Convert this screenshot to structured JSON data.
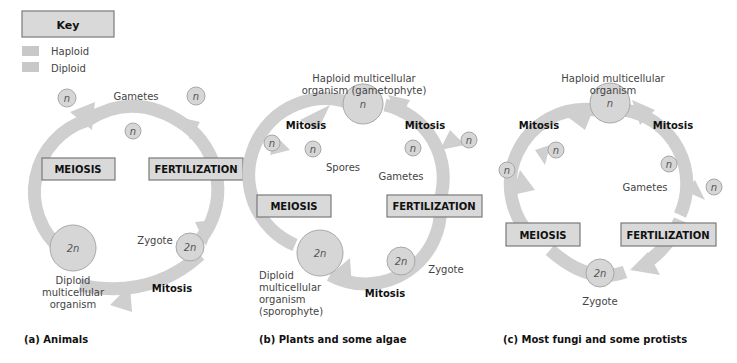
{
  "key": {
    "title": "Key",
    "items": [
      {
        "label": "Haploid",
        "color": "#c8c8c8"
      },
      {
        "label": "Diploid",
        "color": "#c8c8c8"
      }
    ]
  },
  "colors": {
    "arrow": "#cfcfcf",
    "circle_fill": "#d6d6d6",
    "circle_stroke": "#a8a8a8",
    "box_fill": "#d9d9d9",
    "box_stroke": "#7a7a7a"
  },
  "panels": [
    {
      "caption": "(a) Animals",
      "labels": {
        "gametes": "Gametes",
        "meiosis": "MEIOSIS",
        "fertilization": "FERTILIZATION",
        "zygote": "Zygote",
        "mitosis": "Mitosis",
        "diploid_org_1": "Diploid",
        "diploid_org_2": "multicellular",
        "diploid_org_3": "organism",
        "n": "n",
        "two_n": "2n"
      }
    },
    {
      "caption": "(b) Plants and some algae",
      "labels": {
        "haploid_org_1": "Haploid multicellular",
        "haploid_org_2": "organism (gametophyte)",
        "mitosis_left": "Mitosis",
        "mitosis_right": "Mitosis",
        "spores": "Spores",
        "gametes": "Gametes",
        "meiosis": "MEIOSIS",
        "fertilization": "FERTILIZATION",
        "zygote": "Zygote",
        "mitosis_bottom": "Mitosis",
        "diploid_org_1": "Diploid",
        "diploid_org_2": "multicellular",
        "diploid_org_3": "organism",
        "diploid_org_4": "(sporophyte)",
        "n": "n",
        "two_n": "2n"
      }
    },
    {
      "caption": "(c) Most fungi and some protists",
      "labels": {
        "haploid_org_1": "Haploid multicellular",
        "haploid_org_2": "organism",
        "mitosis_left": "Mitosis",
        "mitosis_right": "Mitosis",
        "gametes": "Gametes",
        "meiosis": "MEIOSIS",
        "fertilization": "FERTILIZATION",
        "zygote": "Zygote",
        "n": "n",
        "two_n": "2n"
      }
    }
  ]
}
